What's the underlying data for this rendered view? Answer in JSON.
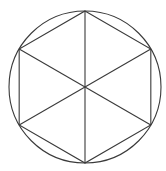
{
  "diagram": {
    "shapes": {
      "circle": {
        "name": "circumscribed-circle"
      },
      "hexagon": {
        "name": "inscribed-hexagon",
        "sides": 6,
        "orientation": "vertex-up"
      },
      "diagonals": {
        "count": 3,
        "through_center": true
      }
    },
    "stroke_color": "#3a3a3a",
    "background_color": "#ffffff"
  }
}
